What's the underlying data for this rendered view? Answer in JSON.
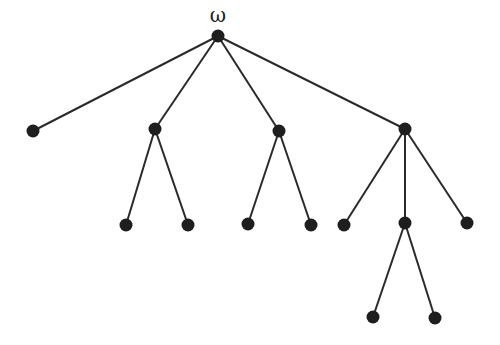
{
  "diagram": {
    "type": "tree",
    "root_label": "ω",
    "nodes": [
      {
        "id": "root",
        "x": 218,
        "y": 36
      },
      {
        "id": "a",
        "x": 33,
        "y": 131
      },
      {
        "id": "b",
        "x": 155,
        "y": 129
      },
      {
        "id": "c",
        "x": 279,
        "y": 131
      },
      {
        "id": "d",
        "x": 405,
        "y": 129
      },
      {
        "id": "b1",
        "x": 126,
        "y": 225
      },
      {
        "id": "b2",
        "x": 188,
        "y": 225
      },
      {
        "id": "c1",
        "x": 248,
        "y": 224
      },
      {
        "id": "c2",
        "x": 311,
        "y": 225
      },
      {
        "id": "d1",
        "x": 344,
        "y": 225
      },
      {
        "id": "d2",
        "x": 405,
        "y": 223
      },
      {
        "id": "d3",
        "x": 467,
        "y": 223
      },
      {
        "id": "d2a",
        "x": 373,
        "y": 317
      },
      {
        "id": "d2b",
        "x": 435,
        "y": 318
      }
    ],
    "edges": [
      [
        "root",
        "a"
      ],
      [
        "root",
        "b"
      ],
      [
        "root",
        "c"
      ],
      [
        "root",
        "d"
      ],
      [
        "b",
        "b1"
      ],
      [
        "b",
        "b2"
      ],
      [
        "c",
        "c1"
      ],
      [
        "c",
        "c2"
      ],
      [
        "d",
        "d1"
      ],
      [
        "d",
        "d2"
      ],
      [
        "d",
        "d3"
      ],
      [
        "d2",
        "d2a"
      ],
      [
        "d2",
        "d2b"
      ]
    ]
  }
}
